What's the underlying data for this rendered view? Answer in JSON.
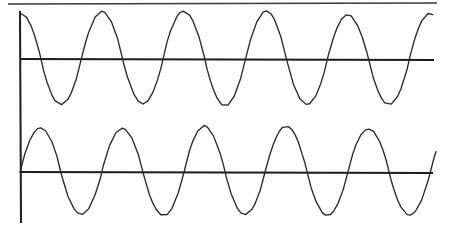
{
  "figure": {
    "background_color": "#fefefe",
    "width": 449,
    "height": 229,
    "ink_color": "#2a2a2a",
    "axis_color": "#1c1c1c",
    "border_color": "#3a3a3a",
    "style": "hand-drawn scanned line figure, no text labels"
  },
  "top_border": {
    "name": "top-border-rule",
    "x1": 8,
    "y1": 4,
    "x2": 437,
    "y2": 3,
    "stroke_width": 1.6
  },
  "vertical_axis": {
    "name": "shared-vertical-axis",
    "x1": 20,
    "y1": 11,
    "x2": 21,
    "y2": 223,
    "stroke_width": 2.0
  },
  "chart_data": {
    "type": "line",
    "subtitle": "",
    "xlabel": "",
    "ylabel": "",
    "xlim": [
      0,
      5.1
    ],
    "ylim": [
      -1.12,
      1.12
    ],
    "grid": false,
    "legend": "none",
    "tick_labels_x": [],
    "tick_labels_y": [],
    "annotations": [],
    "x": [
      0,
      0.05,
      0.1,
      0.15,
      0.2,
      0.25,
      0.3,
      0.35,
      0.4,
      0.45,
      0.5,
      0.55,
      0.6,
      0.65,
      0.7,
      0.75,
      0.8,
      0.85,
      0.9,
      0.95,
      1.0,
      1.05,
      1.1,
      1.15,
      1.2,
      1.25,
      1.3,
      1.35,
      1.4,
      1.45,
      1.5,
      1.55,
      1.6,
      1.65,
      1.7,
      1.75,
      1.8,
      1.85,
      1.9,
      1.95,
      2.0,
      2.05,
      2.1,
      2.15,
      2.2,
      2.25,
      2.3,
      2.35,
      2.4,
      2.45,
      2.5,
      2.55,
      2.6,
      2.65,
      2.7,
      2.75,
      2.8,
      2.85,
      2.9,
      2.95,
      3.0,
      3.05,
      3.1,
      3.15,
      3.2,
      3.25,
      3.3,
      3.35,
      3.4,
      3.45,
      3.5,
      3.55,
      3.6,
      3.65,
      3.7,
      3.75,
      3.8,
      3.85,
      3.9,
      3.95,
      4.0,
      4.05,
      4.1,
      4.15,
      4.2,
      4.25,
      4.3,
      4.35,
      4.4,
      4.45,
      4.5,
      4.55,
      4.6,
      4.65,
      4.7,
      4.75,
      4.8,
      4.85,
      4.9,
      4.95,
      5.0
    ],
    "series": [
      {
        "name": "upper-waveform",
        "waveform": "cosine",
        "phase_degrees": 0,
        "cycles_shown": 5,
        "amplitude": 1.0,
        "description": "starts at positive peak at the vertical axis",
        "baseline_y_px": 59,
        "peak_y_px": 13,
        "trough_y_px": 105,
        "x_start_px": 20,
        "x_end_px": 434,
        "period_px": 82,
        "baseline": {
          "name": "upper-baseline-axis",
          "x1": 20,
          "y1": 59,
          "x2": 434,
          "y2": 60,
          "stroke_width": 2.1
        }
      },
      {
        "name": "lower-waveform",
        "waveform": "sine",
        "phase_degrees": -90,
        "cycles_shown": 5,
        "amplitude": 1.0,
        "description": "starts at zero rising at the vertical axis, lags upper wave by 90 degrees",
        "baseline_y_px": 172,
        "peak_y_px": 128,
        "trough_y_px": 216,
        "x_start_px": 20,
        "x_end_px": 437,
        "period_px": 82,
        "baseline": {
          "name": "lower-baseline-axis",
          "x1": 20,
          "y1": 172,
          "x2": 433,
          "y2": 173,
          "stroke_width": 2.1
        }
      }
    ]
  }
}
